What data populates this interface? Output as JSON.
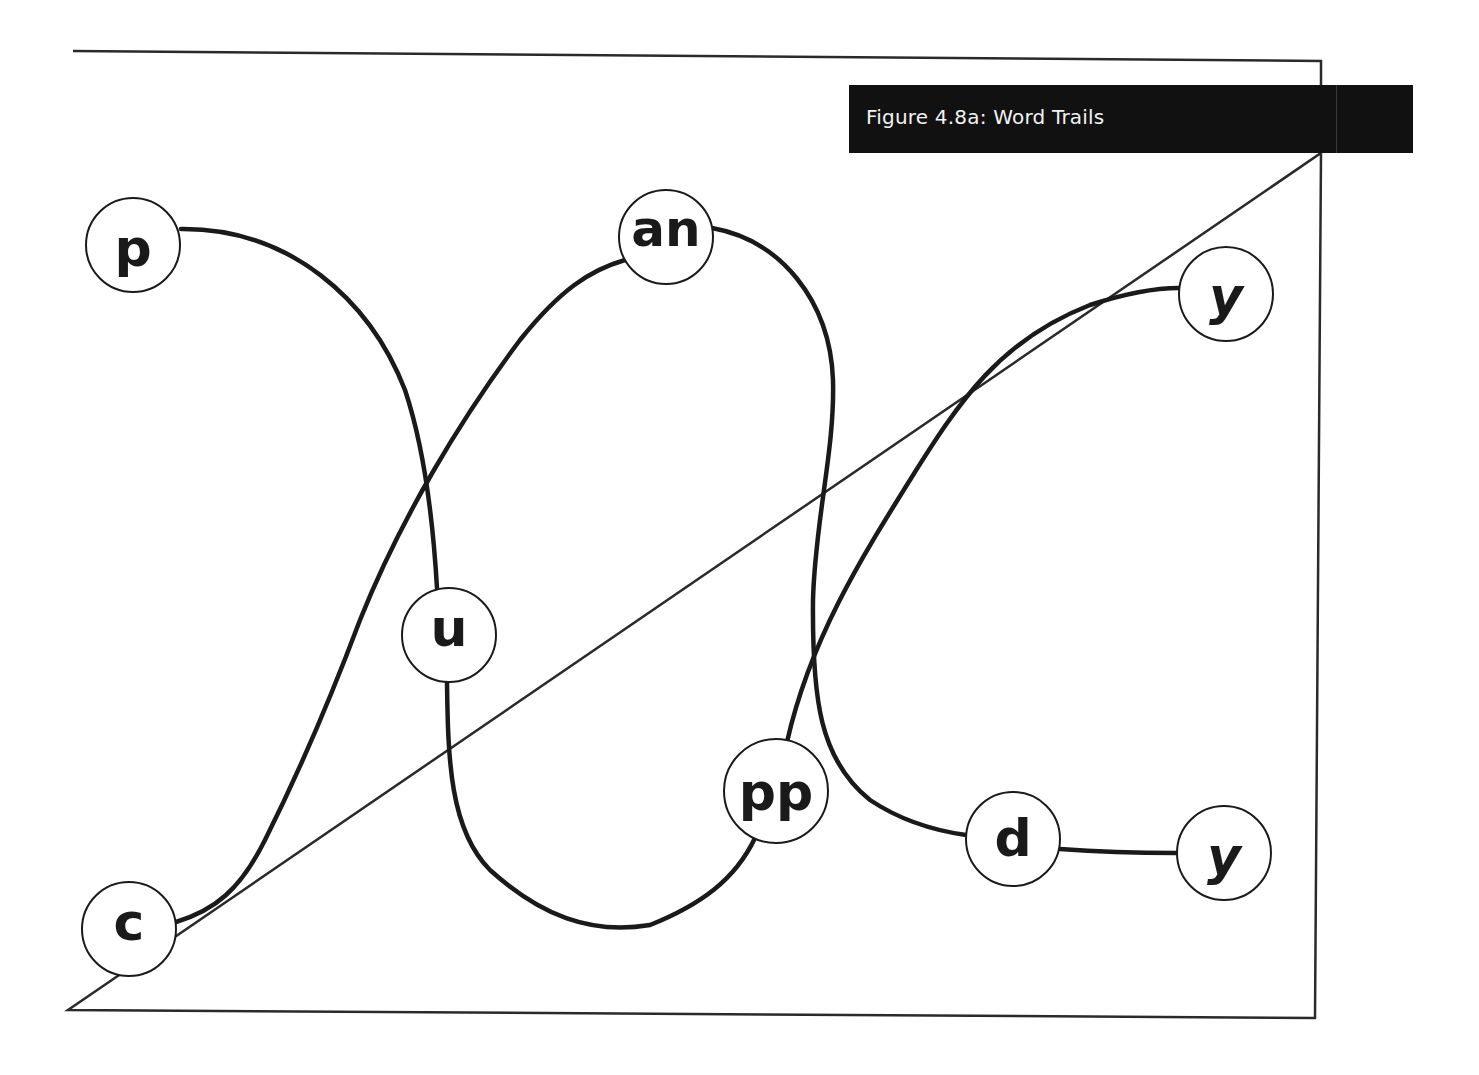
{
  "figure": {
    "title": "Figure 4.8a: Word Trails",
    "colors": {
      "ink": "#1a1a1a",
      "title_bg": "#111111",
      "title_text": "#f2f2f2",
      "background": "#ffffff"
    }
  },
  "nodes": [
    {
      "id": "n1",
      "label": "p",
      "cx": 133,
      "cy": 245,
      "r": 47
    },
    {
      "id": "n2",
      "label": "an",
      "cx": 666,
      "cy": 237,
      "r": 47
    },
    {
      "id": "n3",
      "label": "y",
      "cx": 1226,
      "cy": 294,
      "r": 47
    },
    {
      "id": "n4",
      "label": "u",
      "cx": 449,
      "cy": 635,
      "r": 47
    },
    {
      "id": "n5",
      "label": "pp",
      "cx": 776,
      "cy": 791,
      "r": 52
    },
    {
      "id": "n6",
      "label": "d",
      "cx": 1013,
      "cy": 839,
      "r": 47
    },
    {
      "id": "n7",
      "label": "y",
      "cx": 1224,
      "cy": 853,
      "r": 47
    },
    {
      "id": "n8",
      "label": "c",
      "cx": 129,
      "cy": 929,
      "r": 47
    }
  ],
  "trails": [
    {
      "word": "puppy",
      "path": [
        "p",
        "u",
        "pp",
        "y"
      ]
    },
    {
      "word": "candy",
      "path": [
        "c",
        "an",
        "d",
        "y"
      ]
    }
  ]
}
